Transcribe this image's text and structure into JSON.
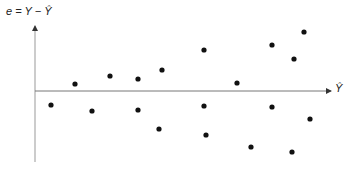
{
  "chart_data": {
    "type": "scatter",
    "title": "",
    "ylabel": "e = Y − Ŷ",
    "xlabel": "Ŷ",
    "grid": false,
    "legend": null,
    "points": [
      {
        "x": 51,
        "y": -14
      },
      {
        "x": 75,
        "y": 7
      },
      {
        "x": 92,
        "y": -20
      },
      {
        "x": 110,
        "y": 15
      },
      {
        "x": 138,
        "y": 12
      },
      {
        "x": 138,
        "y": -19
      },
      {
        "x": 162,
        "y": 21
      },
      {
        "x": 159,
        "y": -38
      },
      {
        "x": 204,
        "y": 41
      },
      {
        "x": 204,
        "y": -15
      },
      {
        "x": 206,
        "y": -44
      },
      {
        "x": 237,
        "y": 8
      },
      {
        "x": 251,
        "y": -56
      },
      {
        "x": 272,
        "y": 46
      },
      {
        "x": 272,
        "y": -16
      },
      {
        "x": 294,
        "y": 32
      },
      {
        "x": 304,
        "y": 59
      },
      {
        "x": 310,
        "y": -28
      },
      {
        "x": 292,
        "y": -61
      }
    ]
  },
  "labels": {
    "y_axis": "e = Y − Ŷ",
    "x_axis": "Ŷ"
  }
}
